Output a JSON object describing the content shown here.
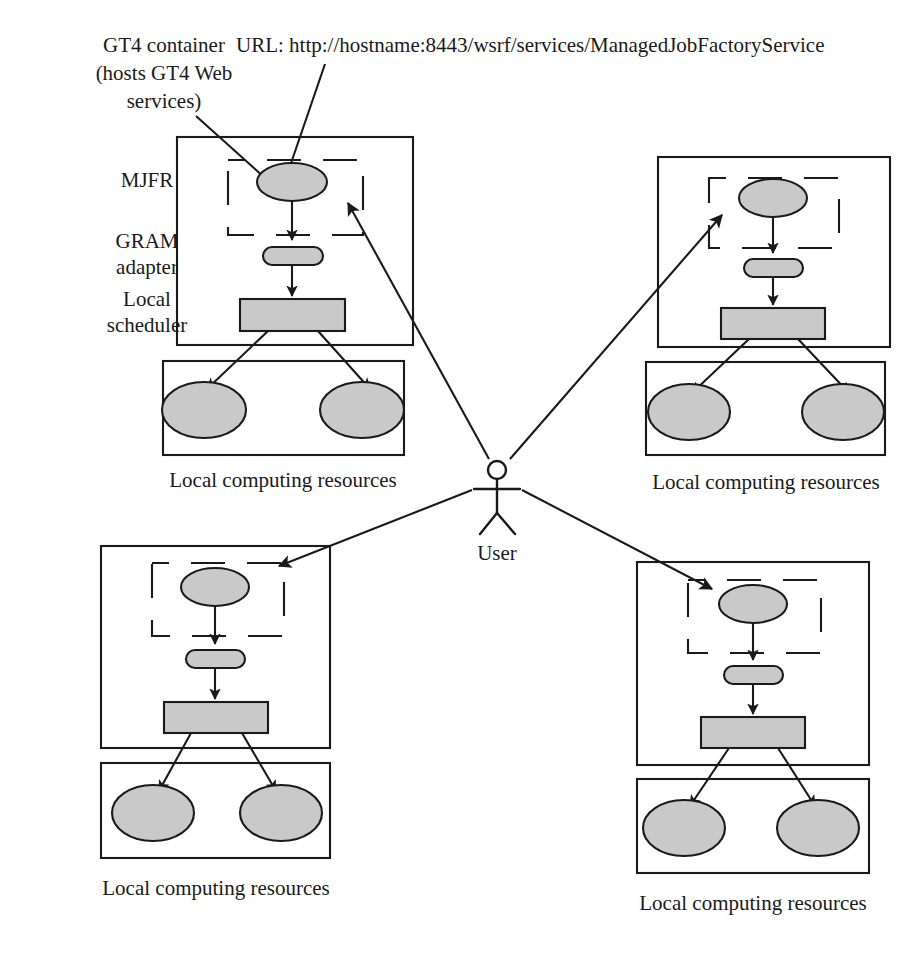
{
  "diagram": {
    "colors": {
      "node_fill": "#c9c9c9",
      "stroke": "#1a1a1a",
      "background": "#ffffff"
    },
    "annotations": {
      "gt4_container": {
        "lines": [
          "GT4 container",
          "(hosts GT4 Web",
          "services)"
        ],
        "line1": "GT4 container",
        "line2": "(hosts GT4 Web",
        "line3": "services)"
      },
      "url": "URL: http://hostname:8443/wsrf/services/ManagedJobFactoryService"
    },
    "row_labels": {
      "mjfr": "MJFR",
      "gram_adapter_line1": "GRAM",
      "gram_adapter_line2": "adapter",
      "local_scheduler_line1": "Local",
      "local_scheduler_line2": "scheduler"
    },
    "actor": {
      "label": "User"
    },
    "clusters": [
      {
        "id": "cluster-top-left",
        "position": "top-left",
        "mjfr_node": "MJFR",
        "gram_node": "GRAM adapter",
        "scheduler_node": "Local scheduler",
        "resource_nodes": [
          "resource-1",
          "resource-2"
        ],
        "caption": "Local computing resources"
      },
      {
        "id": "cluster-top-right",
        "position": "top-right",
        "mjfr_node": "MJFR",
        "gram_node": "GRAM adapter",
        "scheduler_node": "Local scheduler",
        "resource_nodes": [
          "resource-1",
          "resource-2"
        ],
        "caption": "Local computing resources"
      },
      {
        "id": "cluster-bottom-left",
        "position": "bottom-left",
        "mjfr_node": "MJFR",
        "gram_node": "GRAM adapter",
        "scheduler_node": "Local scheduler",
        "resource_nodes": [
          "resource-1",
          "resource-2"
        ],
        "caption": "Local computing resources"
      },
      {
        "id": "cluster-bottom-right",
        "position": "bottom-right",
        "mjfr_node": "MJFR",
        "gram_node": "GRAM adapter",
        "scheduler_node": "Local scheduler",
        "resource_nodes": [
          "resource-1",
          "resource-2"
        ],
        "caption": "Local computing resources"
      }
    ]
  }
}
